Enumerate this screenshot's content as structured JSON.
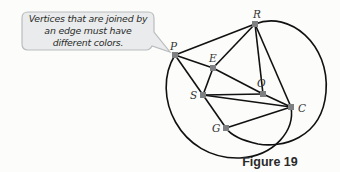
{
  "callout": {
    "text": "Vertices that are joined by an edge must have different colors.",
    "fill": "#e9ebec",
    "stroke": "#b9bcbd"
  },
  "caption": "Figure 19",
  "graph": {
    "vertex_color": "#7d7f80",
    "edge_color": "#111111",
    "vertices": [
      {
        "id": "P",
        "label": "P",
        "x": 175,
        "y": 55,
        "label_dx": -5,
        "label_dy": -14
      },
      {
        "id": "R",
        "label": "R",
        "x": 255,
        "y": 24,
        "label_dx": -2,
        "label_dy": -15
      },
      {
        "id": "E",
        "label": "E",
        "x": 213,
        "y": 68,
        "label_dx": -4,
        "label_dy": -15
      },
      {
        "id": "O",
        "label": "O",
        "x": 263,
        "y": 94,
        "label_dx": -6,
        "label_dy": -16
      },
      {
        "id": "S",
        "label": "S",
        "x": 203,
        "y": 95,
        "label_dx": -13,
        "label_dy": -5
      },
      {
        "id": "C",
        "label": "C",
        "x": 291,
        "y": 107,
        "label_dx": 7,
        "label_dy": -4
      },
      {
        "id": "G",
        "label": "G",
        "x": 226,
        "y": 128,
        "label_dx": -14,
        "label_dy": -5
      }
    ],
    "edges": [
      [
        "P",
        "R"
      ],
      [
        "P",
        "E"
      ],
      [
        "E",
        "O"
      ],
      [
        "P",
        "S"
      ],
      [
        "R",
        "E"
      ],
      [
        "R",
        "O"
      ],
      [
        "R",
        "C"
      ],
      [
        "E",
        "S"
      ],
      [
        "S",
        "O"
      ],
      [
        "S",
        "C"
      ],
      [
        "O",
        "C"
      ],
      [
        "S",
        "G"
      ],
      [
        "G",
        "C"
      ]
    ],
    "curved_edges": [
      {
        "from": "P",
        "to": "C",
        "desc": "arc around bottom-left"
      },
      {
        "from": "R",
        "to": "G",
        "desc": "arc around right and bottom"
      }
    ]
  }
}
